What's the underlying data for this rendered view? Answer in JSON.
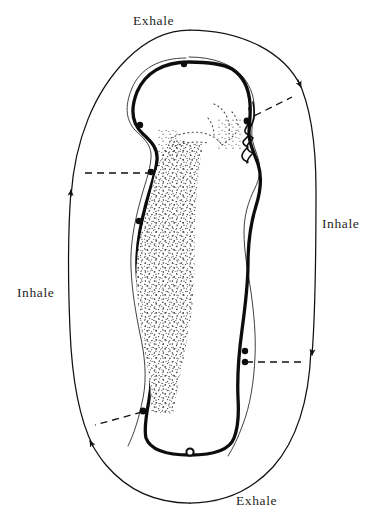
{
  "diagram": {
    "background_color": "#ffffff",
    "ink_color": "#111111",
    "labels": {
      "exhale_top": "Exhale",
      "exhale_bottom": "Exhale",
      "inhale_left": "Inhale",
      "inhale_right": "Inhale"
    },
    "flow": {
      "outer_path": "ellipse",
      "arrows": [
        {
          "name": "arrow-upper-right",
          "direction": "down",
          "phase": "Inhale",
          "x": 295,
          "y": 95
        },
        {
          "name": "arrow-lower-right",
          "direction": "down",
          "phase": "Inhale",
          "x": 312,
          "y": 363
        },
        {
          "name": "arrow-upper-left",
          "direction": "up",
          "phase": "Inhale",
          "x": 73,
          "y": 172
        },
        {
          "name": "arrow-lower-left",
          "direction": "up-left",
          "phase": "Inhale",
          "x": 88,
          "y": 427
        }
      ],
      "connectors": [
        {
          "name": "connector-head",
          "style": "dashed",
          "from_x": 243,
          "from_y": 121,
          "to_x": 296,
          "to_y": 95
        },
        {
          "name": "connector-shoulder",
          "style": "dashed",
          "from_x": 155,
          "from_y": 173,
          "to_x": 74,
          "to_y": 173
        },
        {
          "name": "connector-abdomen",
          "style": "dashed",
          "from_x": 243,
          "from_y": 362,
          "to_x": 311,
          "to_y": 362
        },
        {
          "name": "connector-sacrum",
          "style": "dashed",
          "from_x": 143,
          "from_y": 413,
          "to_x": 89,
          "to_y": 427
        }
      ],
      "markers": [
        {
          "name": "marker-crown",
          "type": "filled-dot",
          "x": 184,
          "y": 67
        },
        {
          "name": "marker-face",
          "type": "filled-dot",
          "x": 243,
          "y": 121
        },
        {
          "name": "marker-occiput",
          "type": "filled-dot",
          "x": 156,
          "y": 125
        },
        {
          "name": "marker-shoulder",
          "type": "filled-dot",
          "x": 153,
          "y": 173
        },
        {
          "name": "marker-mid-back",
          "type": "filled-dot",
          "x": 139,
          "y": 222
        },
        {
          "name": "marker-abdomen-upper",
          "type": "filled-dot",
          "x": 242,
          "y": 352
        },
        {
          "name": "marker-abdomen-lower",
          "type": "filled-dot",
          "x": 243,
          "y": 362
        },
        {
          "name": "marker-sacrum",
          "type": "filled-dot",
          "x": 143,
          "y": 412
        },
        {
          "name": "marker-base",
          "type": "open-ring",
          "x": 190,
          "y": 450
        }
      ]
    },
    "figure": {
      "description": "human body seen in profile: head, neck, chest, abdomen, pelvis",
      "spine_texture": "stippled"
    }
  }
}
